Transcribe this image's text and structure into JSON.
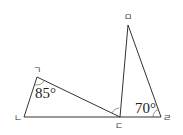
{
  "diagram": {
    "type": "geometry",
    "vertices": [
      {
        "id": "A",
        "label": "ㄱ",
        "x": 37,
        "y": 77
      },
      {
        "id": "B",
        "label": "ㄴ",
        "x": 24,
        "y": 117
      },
      {
        "id": "C",
        "label": "ㄷ",
        "x": 120,
        "y": 117
      },
      {
        "id": "D",
        "label": "ㄹ",
        "x": 161,
        "y": 117
      },
      {
        "id": "E",
        "label": "ㅁ",
        "x": 128,
        "y": 25
      }
    ],
    "segments": [
      [
        "A",
        "B"
      ],
      [
        "B",
        "D"
      ],
      [
        "A",
        "C"
      ],
      [
        "C",
        "E"
      ],
      [
        "E",
        "D"
      ]
    ],
    "angles": {
      "at_A": "85°",
      "at_D": "70°",
      "at_C_marked": ""
    },
    "colors": {
      "line": "#333333",
      "text": "#222222",
      "background": "#ffffff"
    }
  }
}
